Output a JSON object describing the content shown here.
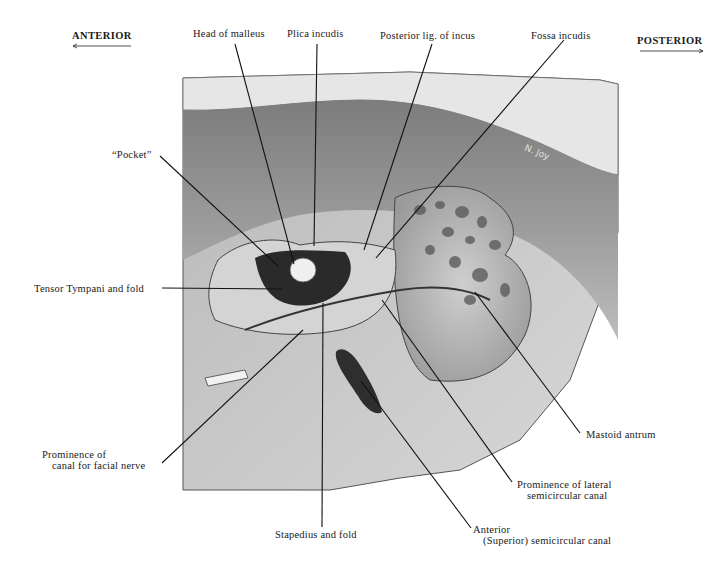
{
  "figure": {
    "orientation": {
      "left": "ANTERIOR",
      "right": "POSTERIOR"
    },
    "signature": "N. Joy",
    "labels": {
      "head_of_malleus": "Head of malleus",
      "plica_incudis": "Plica incudis",
      "posterior_lig_incus": "Posterior lig. of incus",
      "fossa_incudis": "Fossa incudis",
      "pocket": "“Pocket”",
      "tensor_tympani": "Tensor Tympani and fold",
      "facial_nerve_line1": "Prominence of",
      "facial_nerve_line2": "canal for facial nerve",
      "stapedius": "Stapedius and fold",
      "mastoid_antrum": "Mastoid antrum",
      "lateral_canal_line1": "Prominence of lateral",
      "lateral_canal_line2": "semicircular canal",
      "anterior_canal_line1": "Anterior",
      "anterior_canal_line2": "(Superior) semicircular canal"
    }
  }
}
